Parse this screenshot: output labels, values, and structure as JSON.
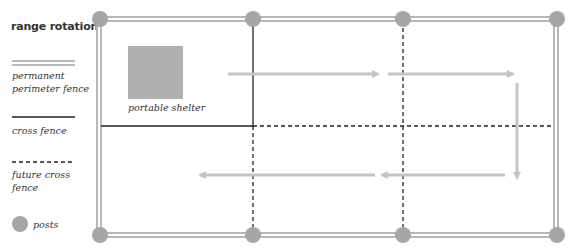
{
  "legend": {
    "title": "range rotation",
    "items": [
      {
        "type": "permanent-perimeter-fence",
        "line1": "permanent",
        "line2": "perimeter fence"
      },
      {
        "type": "cross-fence",
        "line1": "cross fence"
      },
      {
        "type": "future-cross-fence",
        "line1": "future cross",
        "line2": "fence"
      },
      {
        "type": "posts",
        "line1": "posts"
      }
    ]
  },
  "diagram": {
    "shelter_label": "portable shelter",
    "colors": {
      "perimeter": "#b8b8b8",
      "post": "#a6a6a6",
      "shelter": "#b0b0b0",
      "arrow": "#c4c4c4",
      "cross_fence": "#222222",
      "future_fence": "#222222",
      "text": "#333333"
    }
  }
}
